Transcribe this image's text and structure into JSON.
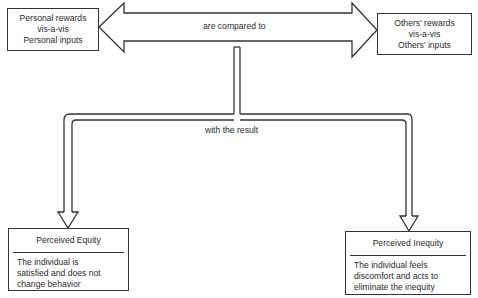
{
  "diagram": {
    "source_left": {
      "lines": [
        "Personal rewards",
        "vis-a-vis",
        "Personal inputs"
      ]
    },
    "source_right": {
      "lines": [
        "Others' rewards",
        "vis-a-vis",
        "Others' inputs"
      ]
    },
    "comparison_label": "are compared to",
    "result_label": "with the result",
    "outcome_left": {
      "title": "Perceived Equity",
      "body_lines": [
        "The individual is",
        "satisfied and does not",
        "change behavior"
      ]
    },
    "outcome_right": {
      "title": "Perceived Inequity",
      "body_lines": [
        "The individual feels",
        "discomfort and acts to",
        "eliminate the inequity"
      ]
    },
    "stroke_color": "#333333"
  }
}
